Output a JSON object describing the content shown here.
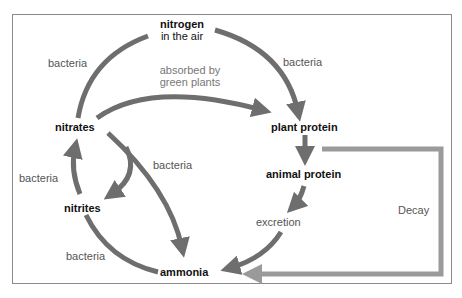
{
  "diagram": {
    "nodes": {
      "nitrogen_line1": "nitrogen",
      "nitrogen_line2": "in the air",
      "nitrates": "nitrates",
      "nitrites": "nitrites",
      "ammonia": "ammonia",
      "plant_protein": "plant protein",
      "animal_protein": "animal protein",
      "excretion": "excretion"
    },
    "labels": {
      "bacteria_top_left": "bacteria",
      "bacteria_top_right": "bacteria",
      "absorbed_line1": "absorbed by",
      "absorbed_line2": "green plants",
      "bacteria_middle": "bacteria",
      "bacteria_left": "bacteria",
      "bacteria_bottom_left": "bacteria",
      "decay": "Decay"
    },
    "colors": {
      "arrow": "#6e6e6e",
      "decay_arrow": "#9a9a9a",
      "frame": "#8a8a8a"
    }
  }
}
